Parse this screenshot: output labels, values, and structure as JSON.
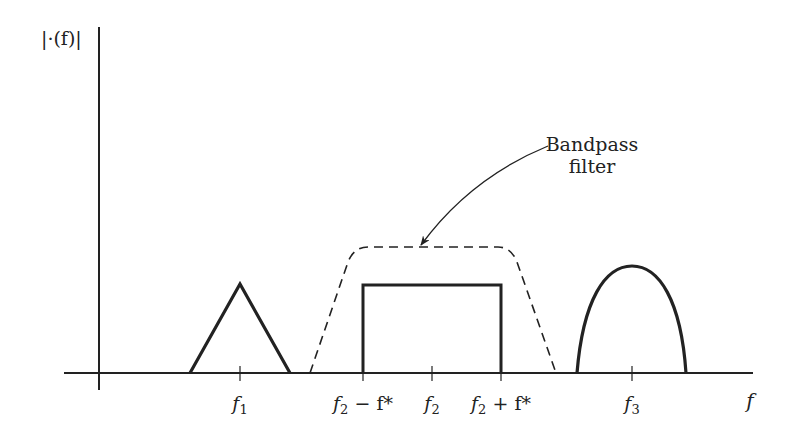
{
  "diagram": {
    "y_axis_label": "|·(f)|",
    "x_axis_label": "f",
    "annotation": {
      "line1": "Bandpass",
      "line2": "filter",
      "points_to": "dashed-bandpass-filter-response"
    },
    "ticks": [
      {
        "id": "f1",
        "base": "f",
        "sub": "1",
        "suffix": ""
      },
      {
        "id": "f2-minus",
        "base": "f",
        "sub": "2",
        "suffix": " − f*"
      },
      {
        "id": "f2",
        "base": "f",
        "sub": "2",
        "suffix": ""
      },
      {
        "id": "f2-plus",
        "base": "f",
        "sub": "2",
        "suffix": " + f*"
      },
      {
        "id": "f3",
        "base": "f",
        "sub": "3",
        "suffix": ""
      }
    ],
    "spectra": [
      {
        "name": "triangle-spectrum",
        "center": "f1",
        "shape": "triangle"
      },
      {
        "name": "rectangle-spectrum",
        "center": "f2",
        "shape": "rectangle",
        "span": "f2 - f* to f2 + f*"
      },
      {
        "name": "arch-spectrum",
        "center": "f3",
        "shape": "arch"
      }
    ],
    "filter": {
      "name": "bandpass-filter",
      "style": "dashed",
      "shape": "trapezoid"
    },
    "colors": {
      "line": "#222222",
      "background": "#ffffff"
    }
  }
}
